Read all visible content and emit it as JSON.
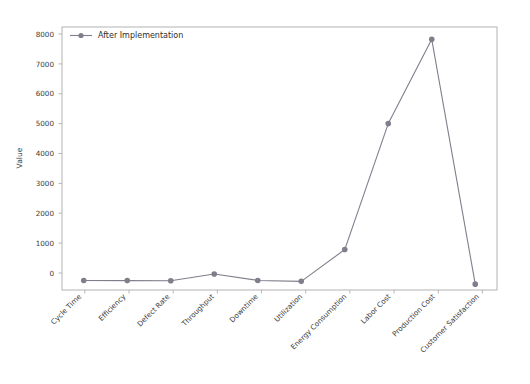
{
  "chart_data": {
    "type": "line",
    "title": "",
    "xlabel": "",
    "ylabel": "Value",
    "categories": [
      "Cycle Time",
      "Efficiency",
      "Defect Rate",
      "Throughput",
      "Downtime",
      "Utilization",
      "Energy Consumption",
      "Labor Cost",
      "Production Cost",
      "Customer Satisfaction"
    ],
    "series": [
      {
        "name": "After Implementation",
        "color": "#7f7f8c",
        "marker": "circle",
        "values": [
          20,
          15,
          10,
          230,
          20,
          -10,
          1020,
          5100,
          7830,
          -100
        ]
      }
    ],
    "yticks": [
      0,
      1000,
      2000,
      3000,
      4000,
      5000,
      6000,
      7000,
      8000
    ],
    "ytick_labels": [
      "0",
      "1000",
      "2000",
      "3000",
      "4000",
      "5000",
      "6000",
      "7000",
      "8000"
    ],
    "ylim": [
      -290,
      8230
    ],
    "grid": false,
    "legend": {
      "entries": [
        "After Implementation"
      ],
      "position": "upper-left"
    },
    "xtick_rotation": 45
  },
  "axis": {
    "ylabel_text": "Value"
  },
  "legend": {
    "item_0_label": "After Implementation"
  }
}
